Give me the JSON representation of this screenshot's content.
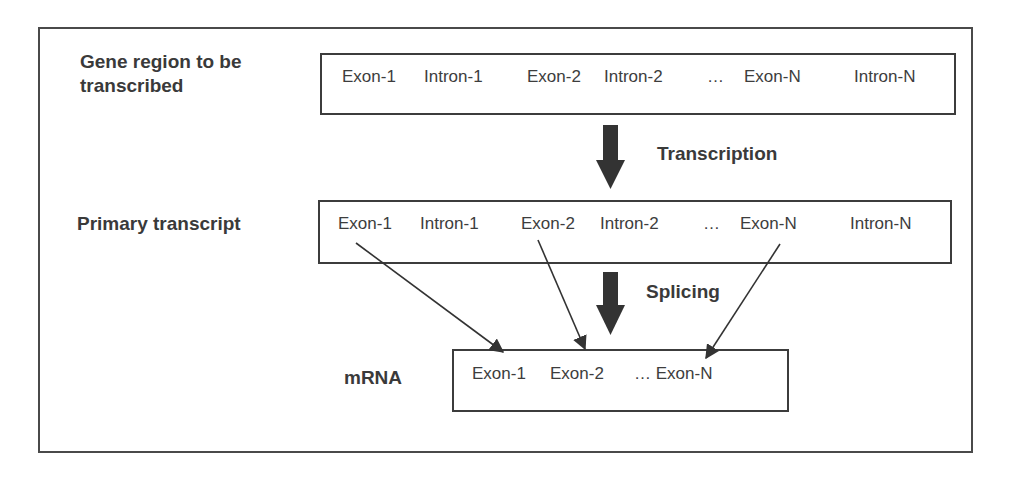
{
  "diagram": {
    "stages": [
      {
        "label_line1": "Gene region to be",
        "label_line2": "transcribed",
        "items": [
          "Exon-1",
          "Intron-1",
          "Exon-2",
          "Intron-2",
          "…",
          "Exon-N",
          "Intron-N"
        ]
      },
      {
        "label": "Primary transcript",
        "items": [
          "Exon-1",
          "Intron-1",
          "Exon-2",
          "Intron-2",
          "…",
          "Exon-N",
          "Intron-N"
        ]
      },
      {
        "label": "mRNA",
        "items": [
          "Exon-1",
          "Exon-2",
          "… Exon-N"
        ]
      }
    ],
    "processes": [
      "Transcription",
      "Splicing"
    ],
    "colors": {
      "stroke": "#3c3c3c",
      "text": "#3a3a3a",
      "arrow_fill": "#333333"
    }
  }
}
